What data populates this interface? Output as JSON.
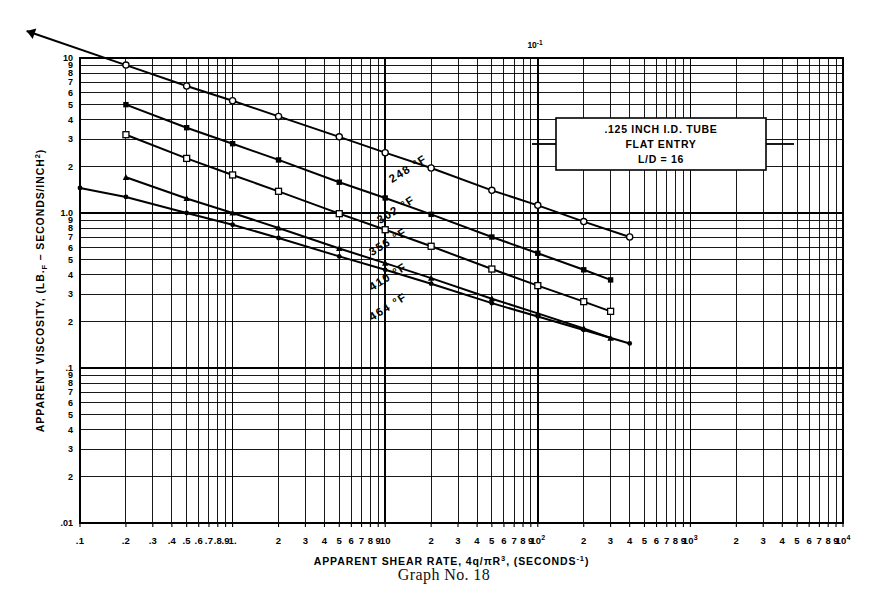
{
  "caption": "Graph No. 18",
  "annotation": {
    "line1": ".125 INCH I.D. TUBE",
    "line2": "FLAT ENTRY",
    "line3": "L/D = 16"
  },
  "top_marker": "10",
  "top_marker_exp": "-1",
  "axes": {
    "xlabel_main": "APPARENT SHEAR RATE,  4q/πR",
    "xlabel_exp": "3",
    "xlabel_tail": ", (SECONDS",
    "xlabel_tail_exp": "-1",
    "xlabel_close": ")",
    "ylabel_main": "APPARENT VISCOSITY, (LB.",
    "ylabel_sub": "F",
    "ylabel_tail": " – SECONDS/INCH",
    "ylabel_exp": "2",
    "ylabel_close": ")"
  },
  "chart_data": {
    "type": "line",
    "title": "Graph No. 18",
    "xlabel": "APPARENT SHEAR RATE, 4q/πR^3, (SECONDS^-1)",
    "ylabel": "APPARENT VISCOSITY, (LB.F - SECONDS/INCH^2)",
    "xscale": "log",
    "yscale": "log",
    "xlim": [
      0.1,
      10000
    ],
    "ylim": [
      0.01,
      10
    ],
    "grid": true,
    "legend": "inline-curve-labels",
    "x_tick_labels": [
      ".1",
      ".2",
      "3",
      "4",
      ".5",
      "6",
      "7",
      "8",
      "9",
      "1.",
      "2",
      "3",
      "4",
      "5",
      "6",
      "7",
      "8",
      "9",
      "10",
      "2",
      "3",
      "4",
      "5",
      "6",
      "7",
      "8",
      "9",
      "10²",
      "2",
      "3",
      "4",
      "5",
      "6",
      "7",
      "8",
      "9",
      "10³",
      "2",
      "3",
      "4",
      "5",
      "6",
      "7",
      "8",
      "9",
      "10⁴"
    ],
    "y_tick_labels": [
      "10",
      "9",
      "8",
      "7",
      "6",
      "5",
      "4",
      "3",
      "2",
      "1.0",
      "9",
      "8",
      "7",
      "6",
      "5",
      "4",
      "3",
      "2",
      ".1",
      "9",
      "8",
      "7",
      "6",
      "5",
      "4",
      "3",
      "2",
      ".01"
    ],
    "series": [
      {
        "name": "248 °F",
        "label": "248 °F",
        "marker": "open-circle",
        "x": [
          0.2,
          0.5,
          1.0,
          2.0,
          5.0,
          10,
          20,
          50,
          100,
          200,
          400
        ],
        "y": [
          9.0,
          6.6,
          5.3,
          4.2,
          3.1,
          2.45,
          1.95,
          1.4,
          1.12,
          0.88,
          0.7
        ]
      },
      {
        "name": "302 °F",
        "label": "302 °F",
        "marker": "filled-square",
        "x": [
          0.2,
          0.5,
          1.0,
          2.0,
          5.0,
          10,
          20,
          50,
          100,
          200,
          300
        ],
        "y": [
          5.0,
          3.55,
          2.8,
          2.2,
          1.58,
          1.25,
          0.98,
          0.7,
          0.55,
          0.43,
          0.37
        ]
      },
      {
        "name": "356 °F",
        "label": "356 °F",
        "marker": "open-square",
        "x": [
          0.2,
          0.5,
          1.0,
          2.0,
          5.0,
          10,
          20,
          50,
          100,
          200,
          300
        ],
        "y": [
          3.2,
          2.25,
          1.76,
          1.38,
          0.99,
          0.78,
          0.61,
          0.435,
          0.34,
          0.268,
          0.232
        ]
      },
      {
        "name": "410 °F",
        "label": "410 °F",
        "marker": "filled-triangle",
        "x": [
          0.2,
          0.5,
          1.0,
          2.0,
          5.0,
          10,
          20,
          50,
          100,
          200,
          300
        ],
        "y": [
          1.7,
          1.24,
          1.0,
          0.8,
          0.59,
          0.475,
          0.38,
          0.28,
          0.225,
          0.18,
          0.156
        ]
      },
      {
        "name": "464 °F",
        "label": "464 °F",
        "marker": "filled-dot",
        "x": [
          0.1,
          0.2,
          0.5,
          1.0,
          2.0,
          5.0,
          10,
          20,
          50,
          100,
          200,
          400
        ],
        "y": [
          1.45,
          1.27,
          1.0,
          0.84,
          0.69,
          0.525,
          0.43,
          0.35,
          0.262,
          0.215,
          0.176,
          0.144
        ]
      }
    ],
    "curve_labels": [
      {
        "text": "248 °F",
        "x": 410,
        "y": 172
      },
      {
        "text": "302 °F",
        "x": 398,
        "y": 213
      },
      {
        "text": "356 °F",
        "x": 390,
        "y": 245
      },
      {
        "text": "410 °F",
        "x": 390,
        "y": 280
      },
      {
        "text": "464 °F",
        "x": 390,
        "y": 310
      }
    ],
    "annotations": [
      {
        "text": ".125 INCH I.D. TUBE",
        "x": 660,
        "y": 133
      },
      {
        "text": "FLAT ENTRY",
        "x": 660,
        "y": 147
      },
      {
        "text": "L/D = 16",
        "x": 660,
        "y": 161
      },
      {
        "text": "10⁻¹",
        "x": 535,
        "y": 47
      }
    ]
  }
}
